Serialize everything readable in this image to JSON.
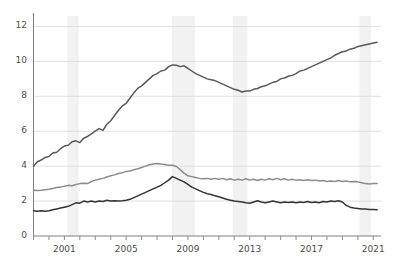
{
  "chart_data": {
    "type": "line",
    "title": "",
    "subtitle": "",
    "xlabel": "",
    "ylabel": "",
    "xlim": [
      1999.0,
      2021.5
    ],
    "ylim": [
      0,
      12.6
    ],
    "grid": true,
    "legend_position": "none",
    "y_ticks": [
      0,
      2,
      4,
      6,
      8,
      10,
      12
    ],
    "y_tick_labels": [
      "0",
      "2",
      "4",
      "6",
      "8",
      "10",
      "12"
    ],
    "x_tick_labels": [
      "2001",
      "2005",
      "2009",
      "2013",
      "2017",
      "2021"
    ],
    "x_tick_values": [
      2001,
      2005,
      2009,
      2013,
      2017,
      2021
    ],
    "x_minor_ticks": [
      1999,
      2000,
      2001,
      2002,
      2003,
      2004,
      2005,
      2006,
      2007,
      2008,
      2009,
      2010,
      2011,
      2012,
      2013,
      2014,
      2015,
      2016,
      2017,
      2018,
      2019,
      2020,
      2021
    ],
    "colors": {
      "series_top": "#595959",
      "series_middle": "#8c8c8c",
      "series_bottom": "#333333",
      "gridline": "#d9d9d9",
      "axis": "#808080",
      "recession_band": "#f2f2f2",
      "tick_text": "#4d4d4d"
    },
    "recession_bands": [
      {
        "start": 2001.2,
        "end": 2001.92
      },
      {
        "start": 2007.95,
        "end": 2009.45
      },
      {
        "start": 2011.9,
        "end": 2012.85
      },
      {
        "start": 2020.1,
        "end": 2020.85
      }
    ],
    "series": [
      {
        "name": "series_top",
        "color": "#595959",
        "x": [
          1999.0,
          1999.25,
          1999.5,
          1999.75,
          2000.0,
          2000.25,
          2000.5,
          2000.75,
          2001.0,
          2001.25,
          2001.5,
          2001.75,
          2002.0,
          2002.25,
          2002.5,
          2002.75,
          2003.0,
          2003.25,
          2003.5,
          2003.75,
          2004.0,
          2004.25,
          2004.5,
          2004.75,
          2005.0,
          2005.25,
          2005.5,
          2005.75,
          2006.0,
          2006.25,
          2006.5,
          2006.75,
          2007.0,
          2007.25,
          2007.5,
          2007.75,
          2008.0,
          2008.25,
          2008.5,
          2008.75,
          2009.0,
          2009.25,
          2009.5,
          2009.75,
          2010.0,
          2010.25,
          2010.5,
          2010.75,
          2011.0,
          2011.25,
          2011.5,
          2011.75,
          2012.0,
          2012.25,
          2012.5,
          2012.75,
          2013.0,
          2013.25,
          2013.5,
          2013.75,
          2014.0,
          2014.25,
          2014.5,
          2014.75,
          2015.0,
          2015.25,
          2015.5,
          2015.75,
          2016.0,
          2016.25,
          2016.5,
          2016.75,
          2017.0,
          2017.25,
          2017.5,
          2017.75,
          2018.0,
          2018.25,
          2018.5,
          2018.75,
          2019.0,
          2019.25,
          2019.5,
          2019.75,
          2020.0,
          2020.25,
          2020.5,
          2020.75,
          2021.0,
          2021.25
        ],
        "values": [
          4.0,
          4.25,
          4.35,
          4.5,
          4.55,
          4.75,
          4.8,
          5.0,
          5.15,
          5.2,
          5.4,
          5.45,
          5.35,
          5.6,
          5.7,
          5.85,
          6.0,
          6.15,
          6.05,
          6.4,
          6.6,
          6.9,
          7.2,
          7.45,
          7.6,
          7.9,
          8.2,
          8.45,
          8.6,
          8.8,
          9.0,
          9.2,
          9.3,
          9.45,
          9.5,
          9.7,
          9.8,
          9.78,
          9.7,
          9.75,
          9.6,
          9.45,
          9.3,
          9.2,
          9.1,
          9.0,
          8.95,
          8.9,
          8.8,
          8.7,
          8.6,
          8.5,
          8.4,
          8.35,
          8.25,
          8.3,
          8.3,
          8.4,
          8.45,
          8.55,
          8.6,
          8.7,
          8.8,
          8.85,
          9.0,
          9.05,
          9.15,
          9.2,
          9.3,
          9.45,
          9.5,
          9.6,
          9.7,
          9.8,
          9.9,
          10.0,
          10.1,
          10.2,
          10.35,
          10.45,
          10.55,
          10.6,
          10.7,
          10.75,
          10.85,
          10.9,
          10.95,
          11.0,
          11.05,
          11.1
        ]
      },
      {
        "name": "series_middle",
        "color": "#8c8c8c",
        "x": [
          1999.0,
          1999.25,
          1999.5,
          1999.75,
          2000.0,
          2000.25,
          2000.5,
          2000.75,
          2001.0,
          2001.25,
          2001.5,
          2001.75,
          2002.0,
          2002.25,
          2002.5,
          2002.75,
          2003.0,
          2003.25,
          2003.5,
          2003.75,
          2004.0,
          2004.25,
          2004.5,
          2004.75,
          2005.0,
          2005.25,
          2005.5,
          2005.75,
          2006.0,
          2006.25,
          2006.5,
          2006.75,
          2007.0,
          2007.25,
          2007.5,
          2007.75,
          2008.0,
          2008.25,
          2008.5,
          2008.75,
          2009.0,
          2009.25,
          2009.5,
          2009.75,
          2010.0,
          2010.25,
          2010.5,
          2010.75,
          2011.0,
          2011.25,
          2011.5,
          2011.75,
          2012.0,
          2012.25,
          2012.5,
          2012.75,
          2013.0,
          2013.25,
          2013.5,
          2013.75,
          2014.0,
          2014.25,
          2014.5,
          2014.75,
          2015.0,
          2015.25,
          2015.5,
          2015.75,
          2016.0,
          2016.25,
          2016.5,
          2016.75,
          2017.0,
          2017.25,
          2017.5,
          2017.75,
          2018.0,
          2018.25,
          2018.5,
          2018.75,
          2019.0,
          2019.25,
          2019.5,
          2019.75,
          2020.0,
          2020.25,
          2020.5,
          2020.75,
          2021.0,
          2021.25
        ],
        "values": [
          2.62,
          2.6,
          2.62,
          2.65,
          2.68,
          2.72,
          2.78,
          2.8,
          2.85,
          2.9,
          2.88,
          2.95,
          3.0,
          3.02,
          3.0,
          3.12,
          3.2,
          3.25,
          3.3,
          3.38,
          3.45,
          3.5,
          3.58,
          3.62,
          3.7,
          3.72,
          3.8,
          3.85,
          3.92,
          4.0,
          4.08,
          4.12,
          4.15,
          4.12,
          4.1,
          4.05,
          4.05,
          3.98,
          3.8,
          3.6,
          3.45,
          3.4,
          3.35,
          3.3,
          3.28,
          3.3,
          3.25,
          3.3,
          3.25,
          3.3,
          3.22,
          3.28,
          3.2,
          3.25,
          3.2,
          3.28,
          3.2,
          3.25,
          3.18,
          3.25,
          3.2,
          3.28,
          3.22,
          3.3,
          3.22,
          3.28,
          3.2,
          3.25,
          3.2,
          3.22,
          3.18,
          3.22,
          3.18,
          3.2,
          3.15,
          3.18,
          3.12,
          3.15,
          3.12,
          3.18,
          3.12,
          3.15,
          3.1,
          3.12,
          3.1,
          3.05,
          3.0,
          2.98,
          3.0,
          3.0
        ]
      },
      {
        "name": "series_bottom",
        "color": "#333333",
        "x": [
          1999.0,
          1999.25,
          1999.5,
          1999.75,
          2000.0,
          2000.25,
          2000.5,
          2000.75,
          2001.0,
          2001.25,
          2001.5,
          2001.75,
          2002.0,
          2002.25,
          2002.5,
          2002.75,
          2003.0,
          2003.25,
          2003.5,
          2003.75,
          2004.0,
          2004.25,
          2004.5,
          2004.75,
          2005.0,
          2005.25,
          2005.5,
          2005.75,
          2006.0,
          2006.25,
          2006.5,
          2006.75,
          2007.0,
          2007.25,
          2007.5,
          2007.75,
          2008.0,
          2008.25,
          2008.5,
          2008.75,
          2009.0,
          2009.25,
          2009.5,
          2009.75,
          2010.0,
          2010.25,
          2010.5,
          2010.75,
          2011.0,
          2011.25,
          2011.5,
          2011.75,
          2012.0,
          2012.25,
          2012.5,
          2012.75,
          2013.0,
          2013.25,
          2013.5,
          2013.75,
          2014.0,
          2014.25,
          2014.5,
          2014.75,
          2015.0,
          2015.25,
          2015.5,
          2015.75,
          2016.0,
          2016.25,
          2016.5,
          2016.75,
          2017.0,
          2017.25,
          2017.5,
          2017.75,
          2018.0,
          2018.25,
          2018.5,
          2018.75,
          2019.0,
          2019.25,
          2019.5,
          2019.75,
          2020.0,
          2020.25,
          2020.5,
          2020.75,
          2021.0,
          2021.25
        ],
        "values": [
          1.45,
          1.42,
          1.45,
          1.42,
          1.45,
          1.5,
          1.55,
          1.6,
          1.65,
          1.7,
          1.8,
          1.9,
          1.88,
          2.0,
          1.95,
          2.0,
          1.95,
          2.0,
          1.98,
          2.05,
          2.0,
          2.02,
          2.0,
          2.02,
          2.05,
          2.1,
          2.2,
          2.3,
          2.4,
          2.5,
          2.6,
          2.7,
          2.8,
          2.9,
          3.05,
          3.2,
          3.4,
          3.3,
          3.2,
          3.1,
          2.95,
          2.8,
          2.7,
          2.6,
          2.5,
          2.42,
          2.38,
          2.3,
          2.25,
          2.18,
          2.1,
          2.05,
          2.0,
          1.98,
          1.95,
          1.9,
          1.88,
          1.95,
          2.02,
          1.95,
          1.9,
          1.95,
          2.0,
          1.95,
          1.9,
          1.95,
          1.92,
          1.95,
          1.9,
          1.95,
          1.92,
          1.98,
          1.92,
          1.95,
          1.9,
          1.98,
          1.95,
          2.0,
          1.98,
          2.02,
          1.95,
          1.75,
          1.65,
          1.6,
          1.58,
          1.55,
          1.55,
          1.52,
          1.52,
          1.5
        ]
      }
    ]
  }
}
